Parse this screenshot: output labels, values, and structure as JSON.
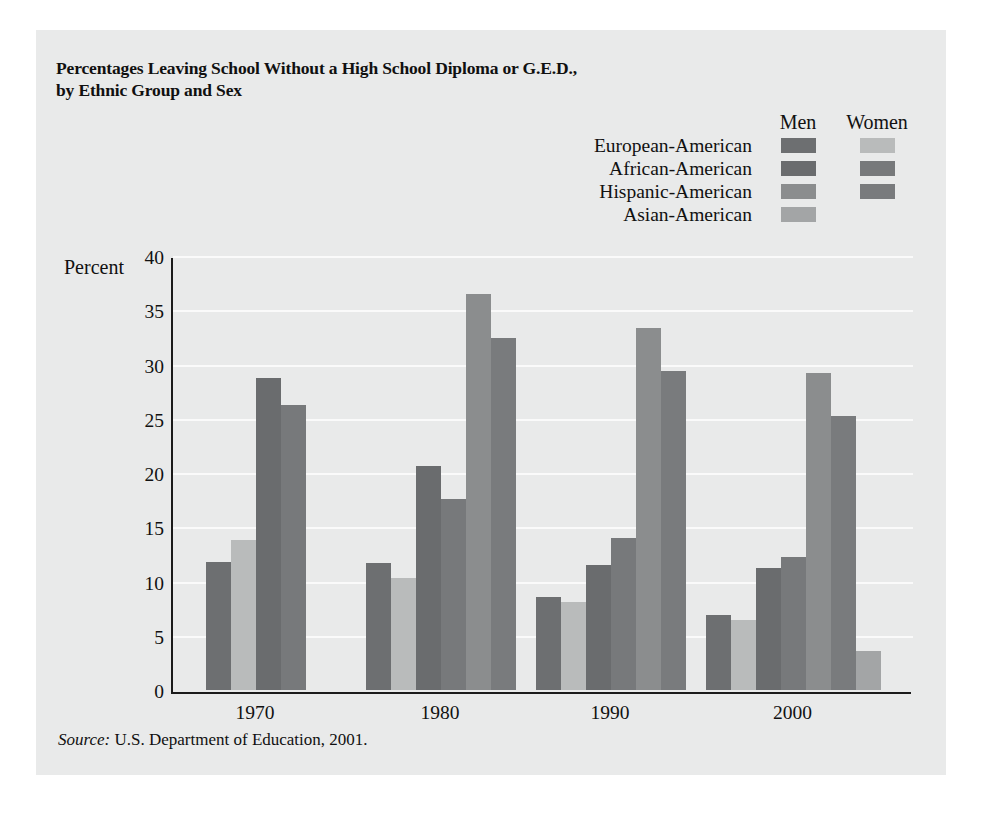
{
  "figure": {
    "title": "Percentages Leaving School Without a High School Diploma or G.E.D., by Ethnic Group and Sex",
    "title_line1": "Percentages Leaving School Without a High School Diploma or G.E.D.,",
    "title_line2": "by Ethnic Group and Sex",
    "source_prefix": "Source:",
    "source_text": " U.S. Department of Education, 2001.",
    "topbar_color": "#6e6f70",
    "panel_color": "#e9eaea"
  },
  "legend": {
    "col_men": "Men",
    "col_women": "Women",
    "rows": [
      {
        "label": "European-American",
        "men_color": "#6d6f71",
        "women_color": "#b9bbbb",
        "has_women": true
      },
      {
        "label": "African-American",
        "men_color": "#6a6c6e",
        "women_color": "#77797b",
        "has_women": true
      },
      {
        "label": "Hispanic-American",
        "men_color": "#8b8d8e",
        "women_color": "#797b7d",
        "has_women": true
      },
      {
        "label": "Asian-American",
        "men_color": "#a3a5a6",
        "women_color": "#a3a5a6",
        "has_women": false
      }
    ]
  },
  "chart_data": {
    "type": "bar",
    "title": "Percentages Leaving School Without a High School Diploma or G.E.D., by Ethnic Group and Sex",
    "xlabel": "",
    "ylabel": "Percent",
    "ylim": [
      0,
      40
    ],
    "ytick_step": 5,
    "ytick_labels": [
      "40",
      "35",
      "30",
      "25",
      "20",
      "15",
      "10",
      "5",
      "0"
    ],
    "ytick_values": [
      40,
      35,
      30,
      25,
      20,
      15,
      10,
      5,
      0
    ],
    "grid": true,
    "legend_position": "top-right",
    "categories": [
      "1970",
      "1980",
      "1990",
      "2000"
    ],
    "series": [
      {
        "name": "European-American Men",
        "color": "#6d6f71",
        "values": [
          11.8,
          11.7,
          8.6,
          6.9
        ]
      },
      {
        "name": "European-American Women",
        "color": "#b9bbbb",
        "values": [
          13.9,
          10.3,
          8.1,
          6.4
        ]
      },
      {
        "name": "African-American Men",
        "color": "#6a6c6e",
        "values": [
          28.9,
          20.7,
          11.5,
          11.3
        ]
      },
      {
        "name": "African-American Women",
        "color": "#77797b",
        "values": [
          26.4,
          17.7,
          14.0,
          12.3
        ]
      },
      {
        "name": "Hispanic-American Men",
        "color": "#8b8d8e",
        "values": [
          null,
          36.7,
          33.5,
          29.3
        ]
      },
      {
        "name": "Hispanic-American Women",
        "color": "#797b7d",
        "values": [
          null,
          32.6,
          29.5,
          25.4
        ]
      },
      {
        "name": "Asian-American Men",
        "color": "#a3a5a6",
        "values": [
          null,
          null,
          null,
          3.6
        ]
      },
      {
        "name": "Asian-American Women",
        "color": "#a3a5a6",
        "values": [
          null,
          null,
          null,
          null
        ]
      }
    ],
    "groups": [
      {
        "category": "1970",
        "bars": [
          {
            "label": "European-American Men",
            "value": 11.8,
            "color": "#6d6f71"
          },
          {
            "label": "European-American Women",
            "value": 13.9,
            "color": "#b9bbbb"
          },
          {
            "label": "African-American Men",
            "value": 28.9,
            "color": "#6a6c6e"
          },
          {
            "label": "African-American Women",
            "value": 26.4,
            "color": "#77797b"
          }
        ]
      },
      {
        "category": "1980",
        "bars": [
          {
            "label": "European-American Men",
            "value": 11.7,
            "color": "#6d6f71"
          },
          {
            "label": "European-American Women",
            "value": 10.3,
            "color": "#b9bbbb"
          },
          {
            "label": "African-American Men",
            "value": 20.7,
            "color": "#6a6c6e"
          },
          {
            "label": "African-American Women",
            "value": 17.7,
            "color": "#77797b"
          },
          {
            "label": "Hispanic-American Men",
            "value": 36.7,
            "color": "#8b8d8e"
          },
          {
            "label": "Hispanic-American Women",
            "value": 32.6,
            "color": "#797b7d"
          }
        ]
      },
      {
        "category": "1990",
        "bars": [
          {
            "label": "European-American Men",
            "value": 8.6,
            "color": "#6d6f71"
          },
          {
            "label": "European-American Women",
            "value": 8.1,
            "color": "#b9bbbb"
          },
          {
            "label": "African-American Men",
            "value": 11.5,
            "color": "#6a6c6e"
          },
          {
            "label": "African-American Women",
            "value": 14.0,
            "color": "#77797b"
          },
          {
            "label": "Hispanic-American Men",
            "value": 33.5,
            "color": "#8b8d8e"
          },
          {
            "label": "Hispanic-American Women",
            "value": 29.5,
            "color": "#797b7d"
          }
        ]
      },
      {
        "category": "2000",
        "bars": [
          {
            "label": "European-American Men",
            "value": 6.9,
            "color": "#6d6f71"
          },
          {
            "label": "European-American Women",
            "value": 6.4,
            "color": "#b9bbbb"
          },
          {
            "label": "African-American Men",
            "value": 11.3,
            "color": "#6a6c6e"
          },
          {
            "label": "African-American Women",
            "value": 12.3,
            "color": "#77797b"
          },
          {
            "label": "Hispanic-American Men",
            "value": 29.3,
            "color": "#8b8d8e"
          },
          {
            "label": "Hispanic-American Women",
            "value": 25.4,
            "color": "#797b7d"
          },
          {
            "label": "Asian-American Men",
            "value": 3.6,
            "color": "#a3a5a6"
          }
        ]
      }
    ]
  }
}
